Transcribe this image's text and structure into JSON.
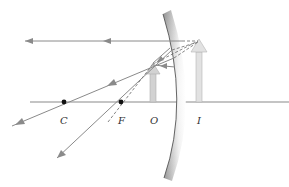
{
  "diagram": {
    "type": "concave-mirror-ray-diagram",
    "labels": {
      "center_of_curvature": "C",
      "focal_point": "F",
      "object": "O",
      "image": "I"
    },
    "colors": {
      "ray": "#8a8a8a",
      "axis": "#8a8a8a",
      "object_arrow": "#cfcfcf",
      "image_arrow": "#d8d8d8",
      "mirror_dark": "#9a9a9a",
      "mirror_light": "#f4f4f4",
      "point": "#111111"
    },
    "positions": {
      "axis_y": 102,
      "C_x": 64,
      "F_x": 121,
      "O_x": 153,
      "I_x": 199
    }
  }
}
